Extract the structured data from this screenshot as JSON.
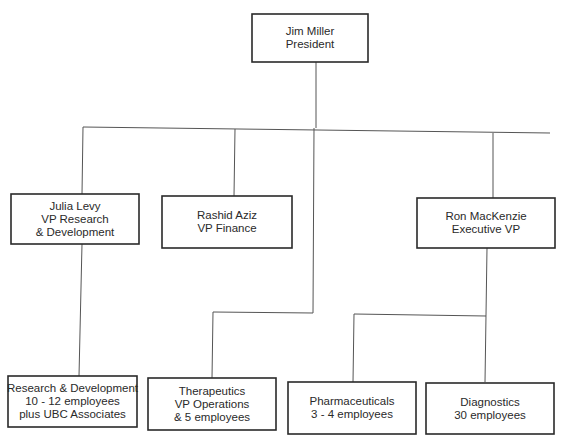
{
  "diagram": {
    "type": "org-chart",
    "nodes": [
      {
        "id": "president",
        "lines": [
          "Jim Miller",
          "President"
        ]
      },
      {
        "id": "vp-research",
        "lines": [
          "Julia Levy",
          "VP Research",
          "& Development"
        ]
      },
      {
        "id": "vp-finance",
        "lines": [
          "Rashid Aziz",
          "VP Finance"
        ]
      },
      {
        "id": "exec-vp",
        "lines": [
          "Ron MacKenzie",
          "Executive VP"
        ]
      },
      {
        "id": "research-dev",
        "lines": [
          "Research & Development",
          "10 - 12 employees",
          "plus UBC Associates"
        ]
      },
      {
        "id": "therapeutics",
        "lines": [
          "Therapeutics",
          "VP Operations",
          "& 5 employees"
        ]
      },
      {
        "id": "pharmaceuticals",
        "lines": [
          "Pharmaceuticals",
          "3 - 4 employees"
        ]
      },
      {
        "id": "diagnostics",
        "lines": [
          "Diagnostics",
          "30 employees"
        ]
      }
    ],
    "edges": [
      {
        "from": "president",
        "to": "vp-research"
      },
      {
        "from": "president",
        "to": "vp-finance"
      },
      {
        "from": "president",
        "to": "exec-vp"
      },
      {
        "from": "president",
        "to": "therapeutics"
      },
      {
        "from": "vp-research",
        "to": "research-dev"
      },
      {
        "from": "exec-vp",
        "to": "pharmaceuticals"
      },
      {
        "from": "exec-vp",
        "to": "diagnostics"
      }
    ]
  }
}
